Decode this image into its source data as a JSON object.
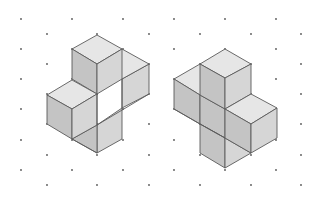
{
  "diagram": {
    "colors": {
      "background": "#ffffff",
      "dot": "#555555",
      "edge": "#5a5a5a",
      "top_face": "#e6e6e6",
      "left_face": "#c4c4c4",
      "right_face": "#d6d6d6"
    },
    "grid": {
      "columns_x": [
        21,
        47,
        72,
        97,
        123,
        149,
        174,
        200,
        225,
        251,
        276,
        301
      ],
      "even_rows_y": [
        19,
        49,
        79,
        109,
        140,
        170
      ],
      "odd_rows_y": [
        34,
        64,
        94,
        124,
        155,
        185
      ]
    },
    "figures": [
      {
        "name": "left-figure",
        "cube_count": 4,
        "faces": [
          {
            "type": "right_face",
            "points": "122,79 149,64 149,94 122,108"
          },
          {
            "type": "top_face",
            "points": "122,49 149,64 122,79 97,64"
          },
          {
            "type": "right_face",
            "points": "97,125 122,108 122,139 97,153"
          },
          {
            "type": "left_face",
            "points": "72,139 97,125 97,153"
          },
          {
            "type": "top_face",
            "points": "97,35 122,49 97,64 72,49"
          },
          {
            "type": "left_face",
            "points": "72,49 97,64 97,94 72,79"
          },
          {
            "type": "right_face",
            "points": "97,64 122,49 122,79 97,94"
          },
          {
            "type": "top_face",
            "points": "72,80 97,94 72,109 47,95"
          },
          {
            "type": "left_face",
            "points": "47,95 72,109 72,139 47,124"
          },
          {
            "type": "right_face",
            "points": "72,109 97,94 97,125 72,139"
          }
        ],
        "extra_edges": [
          "97,94 97,125",
          "122,79 122,108",
          "97,125 149,94",
          "72,139 97,153"
        ]
      },
      {
        "name": "right-figure",
        "cube_count": 5,
        "faces": [
          {
            "type": "top_face",
            "points": "174,79 200,64 225,78 200,95"
          },
          {
            "type": "left_face",
            "points": "174,79 200,95 200,124 174,109"
          },
          {
            "type": "left_face",
            "points": "200,95 225,109 225,138 200,124"
          },
          {
            "type": "left_face",
            "points": "200,124 225,138 225,168 200,153"
          },
          {
            "type": "right_face",
            "points": "225,138 251,153 225,168"
          },
          {
            "type": "top_face",
            "points": "225,49 251,64 225,78 200,64"
          },
          {
            "type": "left_face",
            "points": "200,64 225,78 225,109 200,95"
          },
          {
            "type": "right_face",
            "points": "225,78 251,64 251,94 225,109"
          },
          {
            "type": "top_face",
            "points": "225,109 251,94 277,108 251,124"
          },
          {
            "type": "left_face",
            "points": "225,109 251,124 251,153 225,138"
          },
          {
            "type": "right_face",
            "points": "251,124 277,108 277,138 251,153"
          }
        ],
        "extra_edges": [
          "200,124 225,138",
          "174,109 200,124"
        ]
      }
    ]
  }
}
